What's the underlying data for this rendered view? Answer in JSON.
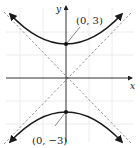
{
  "figure": {
    "type": "hyperbola",
    "equation": "y^2/9 - x^2/9 = 1",
    "axes": {
      "x_label": "x",
      "y_label": "y"
    },
    "vertices": [
      {
        "label": "(0, 3)",
        "x": 0,
        "y": 3
      },
      {
        "label": "(0, −3)",
        "x": 0,
        "y": -3
      }
    ],
    "asymptotes": [
      "y = x",
      "y = −x"
    ],
    "colors": {
      "curve": "#1a1a1a",
      "axis": "#333333",
      "asymptote": "#888888",
      "grid": "#ececec"
    }
  }
}
